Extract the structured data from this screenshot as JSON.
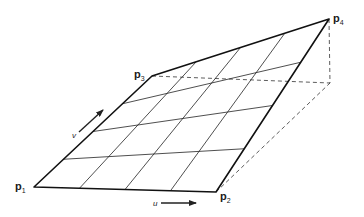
{
  "diagram": {
    "type": "bilinear-surface-patch",
    "colors": {
      "stroke": "#222222",
      "background": "#ffffff"
    },
    "corners": {
      "p1": {
        "label": "p",
        "subscript": "1",
        "x": 34,
        "y": 187
      },
      "p2": {
        "label": "p",
        "subscript": "2",
        "x": 216,
        "y": 192
      },
      "p3": {
        "label": "p",
        "subscript": "3",
        "x": 152,
        "y": 76
      },
      "p4": {
        "label": "p",
        "subscript": "4",
        "x": 329,
        "y": 19
      }
    },
    "grid_divisions": {
      "u": 4,
      "v": 4
    },
    "dashed_projection_corner": {
      "x": 330,
      "y": 83
    },
    "axes": {
      "u": {
        "label": "u",
        "from": [
          161,
          203
        ],
        "to": [
          196,
          203
        ]
      },
      "v": {
        "label": "v",
        "from": [
          79,
          132
        ],
        "to": [
          103,
          110
        ]
      }
    }
  }
}
